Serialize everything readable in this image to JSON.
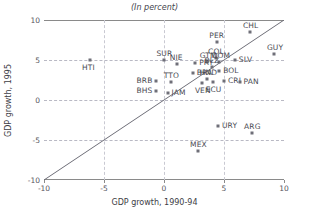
{
  "chart_data": {
    "type": "scatter",
    "title": "(In percent)",
    "xlabel": "GDP growth, 1990-94",
    "ylabel": "GDP growth, 1995",
    "xlim": [
      -10,
      10
    ],
    "ylim": [
      -10,
      10
    ],
    "xticks": [
      -10,
      -5,
      0,
      5,
      10
    ],
    "yticks": [
      -10,
      -5,
      0,
      5,
      10
    ],
    "xticklabels": [
      "-10",
      "-5",
      "0",
      "5",
      "10"
    ],
    "yticklabels": [
      "-10",
      "-5",
      "0",
      "5",
      "10"
    ],
    "grid": true,
    "legend": "none",
    "annotations": [
      {
        "label": "45-degree reference line",
        "from": [
          -10,
          -10
        ],
        "to": [
          10,
          10
        ]
      }
    ],
    "points": [
      {
        "label": "HTI",
        "x": -6.2,
        "y": 5.0,
        "label_pos": "below"
      },
      {
        "label": "SUR",
        "x": 0.0,
        "y": 5.0,
        "label_pos": "above"
      },
      {
        "label": "NIE",
        "x": 1.1,
        "y": 4.5,
        "label_pos": "above"
      },
      {
        "label": "PRY",
        "x": 2.6,
        "y": 4.6,
        "label_pos": "right"
      },
      {
        "label": "GTM",
        "x": 3.6,
        "y": 4.8,
        "label_pos": "above"
      },
      {
        "label": "COL",
        "x": 4.3,
        "y": 5.3,
        "label_pos": "above"
      },
      {
        "label": "DOM",
        "x": 4.6,
        "y": 4.7,
        "label_pos": "above"
      },
      {
        "label": "BLZ",
        "x": 4.0,
        "y": 4.1,
        "label_pos": "above"
      },
      {
        "label": "BOL",
        "x": 4.6,
        "y": 3.6,
        "label_pos": "right"
      },
      {
        "label": "BRA",
        "x": 2.4,
        "y": 3.4,
        "label_pos": "right"
      },
      {
        "label": "HND",
        "x": 3.6,
        "y": 2.6,
        "label_pos": "above"
      },
      {
        "label": "VEN",
        "x": 3.2,
        "y": 2.1,
        "label_pos": "below"
      },
      {
        "label": "ECU",
        "x": 4.1,
        "y": 2.2,
        "label_pos": "below"
      },
      {
        "label": "CRI",
        "x": 5.0,
        "y": 2.4,
        "label_pos": "right"
      },
      {
        "label": "PAN",
        "x": 6.3,
        "y": 2.3,
        "label_pos": "right"
      },
      {
        "label": "BRB",
        "x": -0.7,
        "y": 2.4,
        "label_pos": "left"
      },
      {
        "label": "BHS",
        "x": -0.7,
        "y": 1.1,
        "label_pos": "left"
      },
      {
        "label": "TTO",
        "x": 0.6,
        "y": 2.2,
        "label_pos": "above"
      },
      {
        "label": "JAM",
        "x": 0.3,
        "y": 0.9,
        "label_pos": "right"
      },
      {
        "label": "PER",
        "x": 4.4,
        "y": 7.3,
        "label_pos": "above"
      },
      {
        "label": "CHL",
        "x": 7.2,
        "y": 8.5,
        "label_pos": "above"
      },
      {
        "label": "GUY",
        "x": 9.2,
        "y": 5.7,
        "label_pos": "above"
      },
      {
        "label": "SLV",
        "x": 5.9,
        "y": 5.0,
        "label_pos": "right"
      },
      {
        "label": "URY",
        "x": 4.5,
        "y": -3.3,
        "label_pos": "right"
      },
      {
        "label": "ARG",
        "x": 7.3,
        "y": -4.1,
        "label_pos": "above"
      },
      {
        "label": "MEX",
        "x": 2.8,
        "y": -6.4,
        "label_pos": "above"
      }
    ]
  }
}
